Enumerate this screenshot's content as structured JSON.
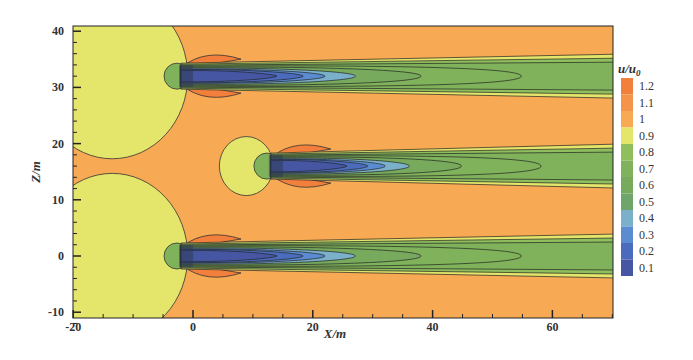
{
  "chart_data": {
    "type": "heatmap",
    "subtype": "filled-contour",
    "title": "",
    "xlabel": "X/m",
    "ylabel": "Z/m",
    "xlim": [
      -20,
      70
    ],
    "ylim": [
      -12,
      41
    ],
    "x_ticks": [
      -20,
      0,
      20,
      40,
      60
    ],
    "y_ticks": [
      -10,
      0,
      10,
      20,
      30,
      40
    ],
    "x_minor_step": 5,
    "y_minor_step": 2,
    "colorbar": {
      "title": "u/u0",
      "title_main": "u/u",
      "title_sub": "0",
      "levels": [
        0.1,
        0.2,
        0.3,
        0.4,
        0.5,
        0.6,
        0.7,
        0.8,
        0.9,
        1,
        1.1,
        1.2
      ],
      "labels": [
        "1.2",
        "1.1",
        "1",
        "0.9",
        "0.8",
        "0.7",
        "0.6",
        "0.5",
        "0.4",
        "0.3",
        "0.2",
        "0.1"
      ],
      "colors": [
        "#f27f3c",
        "#f4944a",
        "#f7a953",
        "#e4e66b",
        "#8fbf5d",
        "#7fb25a",
        "#77aa5d",
        "#6fa46a",
        "#7ab0c9",
        "#5b8bd0",
        "#4b6cbd",
        "#4656a3"
      ]
    },
    "background_value": 1.05,
    "turbines": [
      {
        "x": -2,
        "z": 32,
        "wake_end_x": 70
      },
      {
        "x": 13,
        "z": 16,
        "wake_end_x": 70
      },
      {
        "x": -2,
        "z": 0,
        "wake_end_x": 70
      }
    ],
    "induction_zone": {
      "value": "0.9-1",
      "radius_large": 14,
      "radius_small": 5
    }
  }
}
